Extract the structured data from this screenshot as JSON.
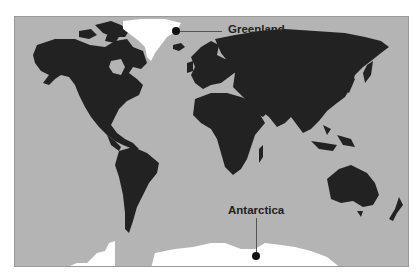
{
  "map": {
    "type": "world-map",
    "colors": {
      "ocean": "#b4b4b4",
      "land": "#222222",
      "highlight": "#ffffff",
      "text": "#222222"
    }
  },
  "callouts": [
    {
      "label": "Greenland",
      "highlighted_region": "greenland"
    },
    {
      "label": "Antarctica",
      "highlighted_region": "antarctica"
    }
  ]
}
